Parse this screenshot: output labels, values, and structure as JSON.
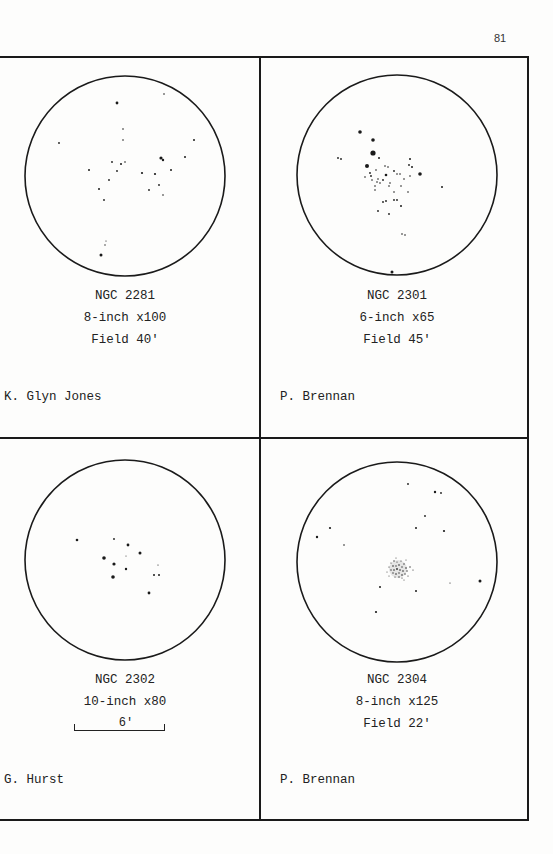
{
  "page_number": "81",
  "panels": [
    {
      "object": "NGC 2281",
      "instrument": "8-inch x100",
      "field": "Field 40'",
      "observer": "K. Glyn Jones"
    },
    {
      "object": "NGC 2301",
      "instrument": "6-inch x65",
      "field": "Field 45'",
      "observer": "P. Brennan"
    },
    {
      "object": "NGC 2302",
      "instrument": "10-inch x80",
      "scale_label": "6'",
      "observer": "G. Hurst"
    },
    {
      "object": "NGC 2304",
      "instrument": "8-inch x125",
      "field": "Field 22'",
      "observer": "P. Brennan"
    }
  ]
}
